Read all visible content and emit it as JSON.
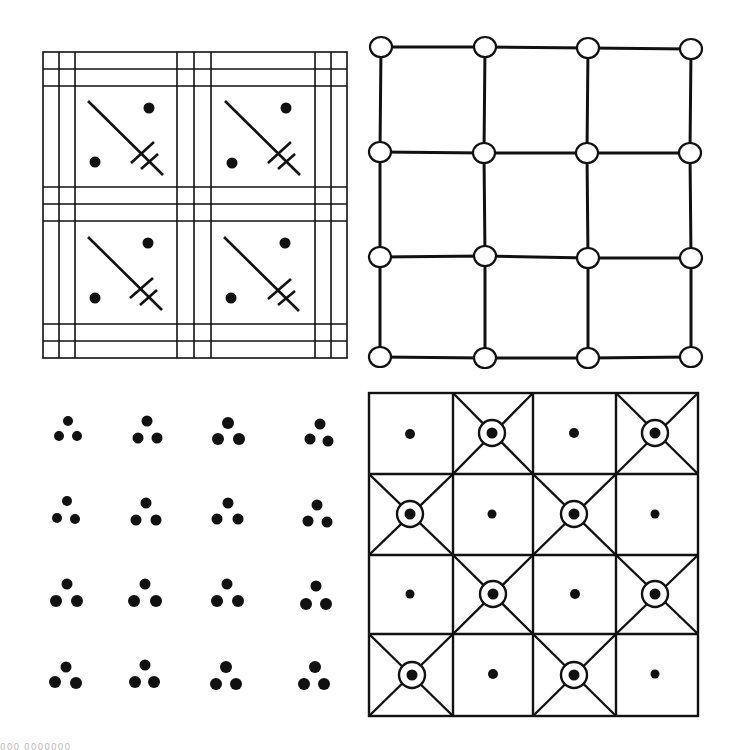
{
  "figure": {
    "panels": [
      {
        "id": "plaid-grid-with-sword-motifs",
        "position": "top-left",
        "cells": 4
      },
      {
        "id": "node-lattice",
        "position": "top-right",
        "rows": 4,
        "cols": 4
      },
      {
        "id": "dot-triads",
        "position": "bottom-left",
        "rows": 4,
        "cols": 4
      },
      {
        "id": "checker-with-ringed-crosses",
        "position": "bottom-right",
        "rows": 4,
        "cols": 4
      }
    ],
    "caption_fragment": "000 0000000",
    "colors": {
      "ink": "#111111",
      "paper": "#ffffff"
    }
  }
}
